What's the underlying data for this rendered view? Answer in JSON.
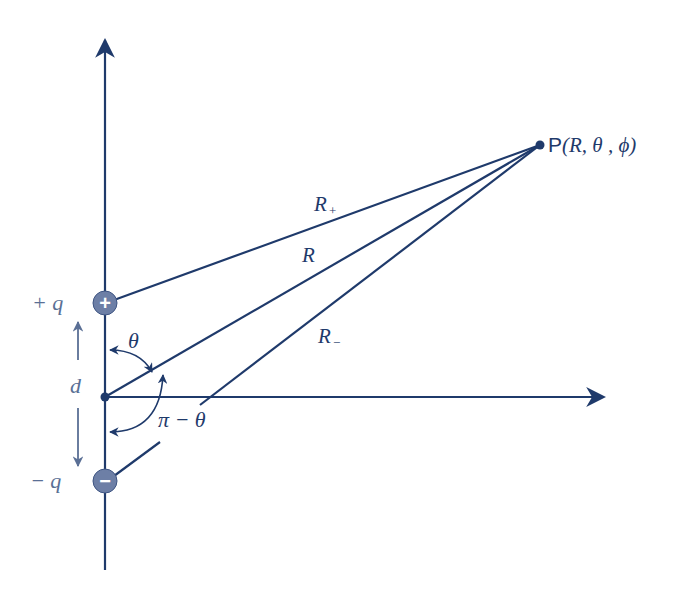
{
  "diagram": {
    "colors": {
      "line": "#1f3a6b",
      "charge_fill": "#6d7fa6",
      "text": "#1f3a6b",
      "muted_text": "#5a6f95"
    },
    "point": {
      "label_prefix": "P",
      "label_args": "(R, θ , ϕ)"
    },
    "charges": {
      "positive": {
        "label": "+ q",
        "symbol": "+"
      },
      "negative": {
        "label": "− q",
        "symbol": "−"
      }
    },
    "lines": {
      "r_plus": {
        "label": "R",
        "subscript": "+"
      },
      "r": {
        "label": "R"
      },
      "r_minus": {
        "label": "R",
        "subscript": "−"
      }
    },
    "angles": {
      "theta": "θ",
      "pi_minus_theta": "π − θ"
    },
    "separation": {
      "label": "d"
    }
  }
}
